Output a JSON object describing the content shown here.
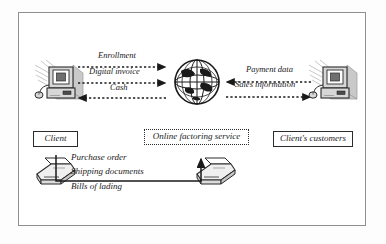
{
  "figure": {
    "frame_color": "#8f8f8f",
    "ink_color": "#1a1a1a",
    "background": "#ffffff"
  },
  "nodes": {
    "client_computer": {
      "icon": "desktop-computer-icon"
    },
    "internet_globe": {
      "icon": "globe-icon"
    },
    "customer_computer": {
      "icon": "desktop-computer-icon"
    },
    "client_printer": {
      "icon": "fax-printer-icon"
    },
    "service_printer": {
      "icon": "fax-printer-icon"
    }
  },
  "boxes": [
    {
      "id": "client",
      "label": "Client",
      "border": "solid"
    },
    {
      "id": "online-factoring-service",
      "label": "Online factoring service",
      "border": "dotted"
    },
    {
      "id": "clients-customers",
      "label": "Client's customers",
      "border": "solid"
    }
  ],
  "flows": {
    "left": [
      {
        "label": "Enrollment",
        "direction": "right",
        "style": "dotted"
      },
      {
        "label": "Digital invoice",
        "direction": "right",
        "style": "dotted"
      },
      {
        "label": "Cash",
        "direction": "left",
        "style": "dotted"
      }
    ],
    "right": [
      {
        "label": "Payment data",
        "direction": "left",
        "style": "dotted"
      },
      {
        "label": "Sales information",
        "direction": "right",
        "style": "dotted"
      }
    ],
    "documents": [
      {
        "label": "Purchase order"
      },
      {
        "label": "Shipping documents"
      },
      {
        "label": "Bills of lading"
      }
    ],
    "document_connector": {
      "direction": "right-up",
      "style": "solid"
    }
  }
}
